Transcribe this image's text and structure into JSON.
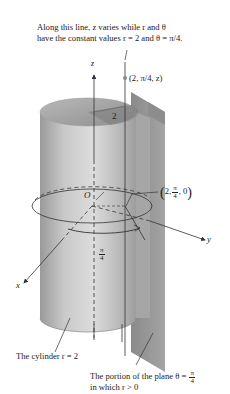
{
  "figure": {
    "top_caption_line1": "Along this line, z varies while r and θ",
    "top_caption_line2": "have the constant values r = 2 and θ = π/4.",
    "point_label_top": "(2, π/4, z)",
    "radius_label": "2",
    "origin_label": "O",
    "axis_z": "z",
    "axis_y": "y",
    "axis_x": "x",
    "point_label_base": {
      "open": "(",
      "first": "2,",
      "frac_num": "π",
      "frac_den": "4",
      "last": ", 0",
      "close": ")"
    },
    "angle_label": {
      "num": "π",
      "den": "4"
    },
    "cylinder_caption": "The cylinder r = 2",
    "plane_caption_line1_pre": "The portion of the plane θ = ",
    "plane_caption_frac": {
      "num": "π",
      "den": "4"
    },
    "plane_caption_line2": "in which r > 0"
  },
  "colors": {
    "cylinder_light": "#d4d4d4",
    "cylinder_mid": "#b5b5b5",
    "cylinder_dark": "#8e8e8e",
    "plane": "#9a9a9a",
    "plane_dark": "#7d7d7d",
    "line": "#333333"
  }
}
